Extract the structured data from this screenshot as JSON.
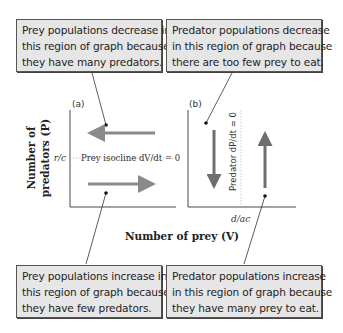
{
  "callouts": {
    "top_left": {
      "lines": [
        "Prey populations decrease in",
        "this region of graph because",
        "they have many predators."
      ]
    },
    "top_right": {
      "lines": [
        "Predator populations decrease",
        "in this region of graph because",
        "there are too few prey to eat."
      ]
    },
    "bottom_left": {
      "lines": [
        "Prey populations increase in",
        "this region of graph because",
        "they have few predators."
      ]
    },
    "bottom_right": {
      "lines": [
        "Predator populations increase",
        "in this region of graph because",
        "they have many prey to eat."
      ]
    }
  },
  "panels": {
    "a": {
      "label": "(a)",
      "isocline_label": "Prey isocline dV/dt = 0",
      "y_tick_label": "r/c"
    },
    "b": {
      "label": "(b)",
      "isocline_label": "Predator dP/dt = 0",
      "x_tick_label": "d/ac"
    }
  },
  "axes": {
    "y_label_line1": "Number of",
    "y_label_line2": "predators (P)",
    "x_label": "Number of prey (V)"
  },
  "colors": {
    "arrow": "#8a8a8a",
    "arrow_dark": "#6e6e6e",
    "box_fill": "#e6e6e6",
    "axis": "#333333",
    "isocline": "#bbbbbb"
  }
}
